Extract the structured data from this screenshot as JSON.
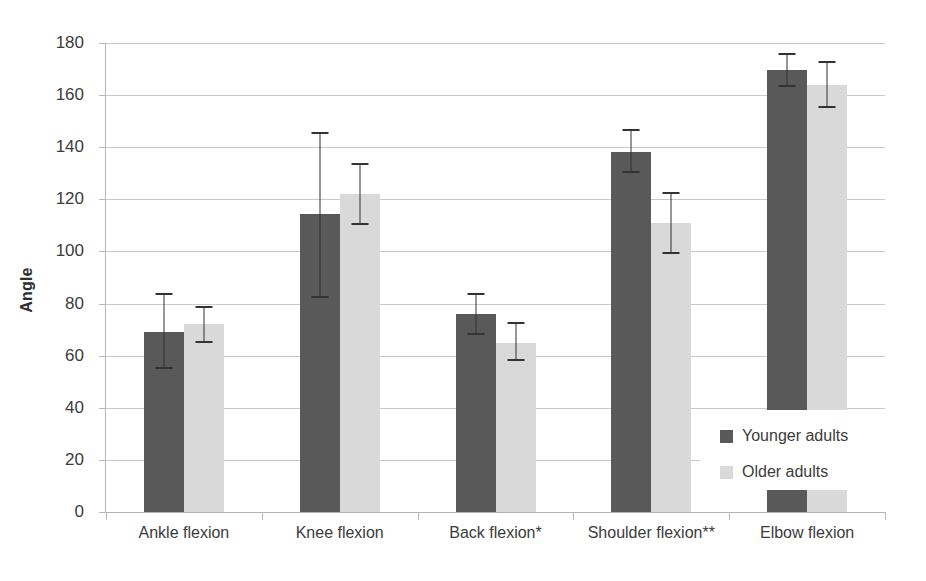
{
  "chart_data": {
    "type": "bar",
    "title": "",
    "subtitle": "",
    "xlabel": "",
    "ylabel": "Angle",
    "ylim": [
      0,
      180
    ],
    "ytick_step": 20,
    "yticks": [
      0,
      20,
      40,
      60,
      80,
      100,
      120,
      140,
      160,
      180
    ],
    "grid": true,
    "legend_position": "inside-right",
    "categories": [
      "Ankle flexion",
      "Knee flexion",
      "Back flexion*",
      "Shoulder flexion**",
      "Elbow flexion"
    ],
    "series": [
      {
        "name": "Younger adults",
        "color": "#595959",
        "values": [
          69,
          114.5,
          76,
          138,
          169.5
        ],
        "error_low": [
          55,
          82,
          68,
          130,
          163
        ],
        "error_high": [
          84,
          146,
          84,
          147,
          176
        ]
      },
      {
        "name": "Older adults",
        "color": "#d9d9d9",
        "values": [
          72,
          122,
          65,
          111,
          164
        ],
        "error_low": [
          65,
          110,
          58,
          99,
          155
        ],
        "error_high": [
          79,
          134,
          73,
          123,
          173
        ]
      }
    ],
    "annotations": [
      "* significant difference",
      "** significant difference"
    ]
  },
  "axes": {
    "y_title": "Angle",
    "y_tick_labels": [
      "180",
      "160",
      "140",
      "120",
      "100",
      "80",
      "60",
      "40",
      "20",
      "0"
    ],
    "x_tick_labels": [
      "Ankle flexion",
      "Knee flexion",
      "Back flexion*",
      "Shoulder flexion**",
      "Elbow flexion"
    ]
  },
  "legend": {
    "items": [
      {
        "label": "Younger adults",
        "color": "#595959"
      },
      {
        "label": "Older adults",
        "color": "#d9d9d9"
      }
    ]
  },
  "colors": {
    "younger": "#595959",
    "older": "#d9d9d9",
    "gridline": "#c9c9c9",
    "axis": "#b3b3b3",
    "error": "#333333",
    "text": "#3c3c3c",
    "background": "#ffffff"
  }
}
